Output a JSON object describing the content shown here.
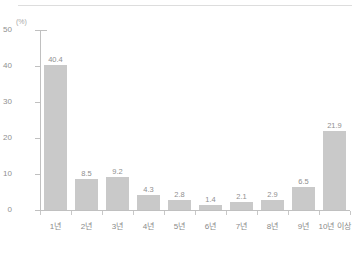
{
  "chart_data": {
    "type": "bar",
    "title": "",
    "subtitle": "",
    "xlabel": "",
    "ylabel": "",
    "unit_label": "(%)",
    "categories": [
      "1년",
      "2년",
      "3년",
      "4년",
      "5년",
      "6년",
      "7년",
      "8년",
      "9년",
      "10년 이상"
    ],
    "values": [
      40.4,
      8.5,
      9.2,
      4.3,
      2.8,
      1.4,
      2.1,
      2.9,
      6.5,
      21.9
    ],
    "value_labels": [
      "40.4",
      "8.5",
      "9.2",
      "4.3",
      "2.8",
      "1.4",
      "2.1",
      "2.9",
      "6.5",
      "21.9"
    ],
    "ylim": [
      0,
      50
    ],
    "y_ticks": [
      50,
      40,
      30,
      20,
      10,
      0
    ],
    "y_tick_labels": [
      "50",
      "40",
      "30",
      "20",
      "10",
      "0"
    ],
    "grid": false,
    "legend": false,
    "legend_position": "none",
    "bar_color": "#c9c9c9",
    "axis_color": "#c0c0c0",
    "text_color": "#8a8a8a",
    "background_color": "#ffffff"
  }
}
